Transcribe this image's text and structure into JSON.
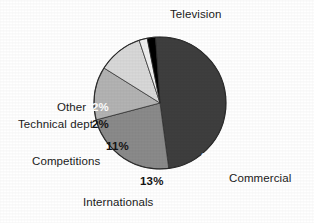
{
  "chart_data": {
    "type": "pie",
    "title": "",
    "subtitle": "",
    "xlabel": "",
    "ylabel": "",
    "legend_position": "none",
    "grid": false,
    "value_suffix": "%",
    "categories": [
      "Television",
      "Commercial",
      "Internationals",
      "Competitions",
      "Technical dept",
      "Other"
    ],
    "values": [
      49,
      23,
      13,
      11,
      2,
      2
    ],
    "slices": [
      {
        "label": "Television",
        "value": 49,
        "value_text": "49%",
        "color": "#3e3e3e",
        "label_text_color": "#1a1a1a",
        "value_text_color": "#ffffff",
        "label_position": "top"
      },
      {
        "label": "Commercial",
        "value": 23,
        "value_text": "23%",
        "color": "#8a8a8a",
        "label_text_color": "#1a1a1a",
        "value_text_color": "#ffffff",
        "label_position": "bottom-right"
      },
      {
        "label": "Internationals",
        "value": 13,
        "value_text": "13%",
        "color": "#b3b3b3",
        "label_text_color": "#1a1a1a",
        "value_text_color": "#141414",
        "label_position": "bottom"
      },
      {
        "label": "Competitions",
        "value": 11,
        "value_text": "11%",
        "color": "#d8d8d8",
        "label_text_color": "#1a1a1a",
        "value_text_color": "#141414",
        "label_position": "left"
      },
      {
        "label": "Technical dept",
        "value": 2,
        "value_text": "2%",
        "color": "#efefef",
        "label_text_color": "#1a1a1a",
        "value_text_color": "#141414",
        "label_position": "upper-left"
      },
      {
        "label": "Other",
        "value": 2,
        "value_text": "2%",
        "color": "#000000",
        "label_text_color": "#1a1a1a",
        "value_text_color": "#ffffff",
        "label_position": "upper-left"
      }
    ]
  }
}
